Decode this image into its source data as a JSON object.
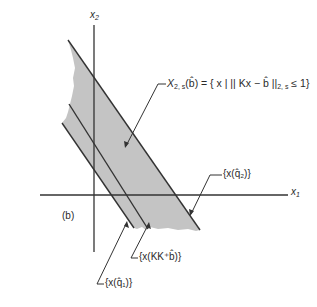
{
  "diagram": {
    "panel_label": "(b)",
    "axes": {
      "x_axis_label": "x",
      "x_axis_sub": "1",
      "y_axis_label": "x",
      "y_axis_sub": "2"
    },
    "region": {
      "label_main": "X",
      "label_sub": "2, s",
      "label_rest": "(b̂) = { x | || Kx − b̂ ||",
      "label_sub2": "2, s",
      "label_end": " ≤ 1}",
      "fill_color": "#c4c4c4"
    },
    "lines": [
      {
        "label": "{x(q̂₂)}"
      },
      {
        "label": "{x(KK⁺b̂)}"
      },
      {
        "label": "{x(q̂₁)}"
      }
    ],
    "colors": {
      "line": "#333333",
      "fill": "#c4c4c4",
      "background": "#ffffff"
    }
  }
}
